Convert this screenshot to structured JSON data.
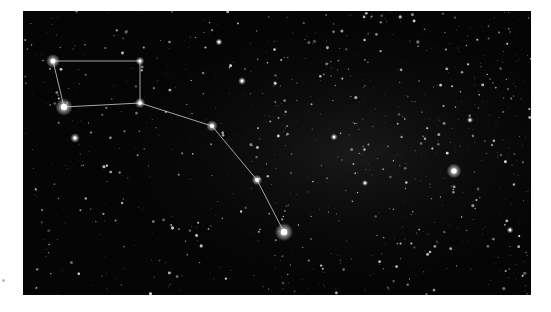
{
  "image": {
    "subject": "Night sky photograph with the Big Dipper asterism outlined",
    "background_color": "#050505",
    "frame": {
      "x": 23,
      "y": 11,
      "width": 508,
      "height": 284
    }
  },
  "constellation": {
    "name": "Big Dipper",
    "line_color": "#d8d8d8",
    "stars": [
      {
        "id": "dubhe",
        "x": 53,
        "y": 61,
        "r": 3.2
      },
      {
        "id": "merak",
        "x": 64,
        "y": 107,
        "r": 4.0
      },
      {
        "id": "phecda",
        "x": 140,
        "y": 61,
        "r": 2.0
      },
      {
        "id": "megrez",
        "x": 140,
        "y": 103,
        "r": 2.4
      },
      {
        "id": "alioth",
        "x": 212,
        "y": 126,
        "r": 2.6
      },
      {
        "id": "mizar",
        "x": 257,
        "y": 180,
        "r": 2.4
      },
      {
        "id": "alkaid",
        "x": 284,
        "y": 232,
        "r": 4.2
      }
    ],
    "lines": [
      [
        "dubhe",
        "phecda"
      ],
      [
        "phecda",
        "megrez"
      ],
      [
        "megrez",
        "merak"
      ],
      [
        "merak",
        "dubhe"
      ],
      [
        "megrez",
        "alioth"
      ],
      [
        "alioth",
        "mizar"
      ],
      [
        "mizar",
        "alkaid"
      ]
    ]
  },
  "bright_stars": [
    {
      "x": 454,
      "y": 171,
      "r": 3.4
    },
    {
      "x": 75,
      "y": 138,
      "r": 2.2
    },
    {
      "x": 219,
      "y": 42,
      "r": 1.6
    },
    {
      "x": 242,
      "y": 81,
      "r": 1.8
    },
    {
      "x": 334,
      "y": 137,
      "r": 1.6
    },
    {
      "x": 365,
      "y": 183,
      "r": 1.4
    },
    {
      "x": 470,
      "y": 120,
      "r": 1.4
    },
    {
      "x": 510,
      "y": 230,
      "r": 1.5
    }
  ]
}
